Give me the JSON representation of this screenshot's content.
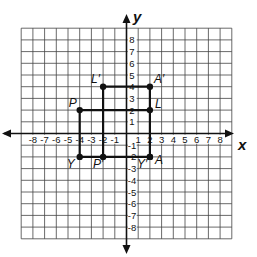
{
  "diagram": {
    "type": "coordinate-grid",
    "x_range": [
      -9,
      9
    ],
    "y_range": [
      -9,
      9
    ],
    "axes": {
      "x_label": "x",
      "y_label": "y"
    },
    "x_tick_labels": [
      "-8",
      "-7",
      "-6",
      "-5",
      "-4",
      "-3",
      "-2",
      "-1",
      "1",
      "2",
      "3",
      "4",
      "5",
      "6",
      "7",
      "8"
    ],
    "y_tick_labels": [
      "8",
      "7",
      "6",
      "5",
      "4",
      "3",
      "2",
      "1",
      "-1",
      "-2",
      "-3",
      "-4",
      "-5",
      "-6",
      "-7",
      "-8"
    ],
    "points": [
      {
        "label": "L′",
        "x": -2,
        "y": 4
      },
      {
        "label": "A′",
        "x": 2,
        "y": 4
      },
      {
        "label": "P",
        "x": -4,
        "y": 2
      },
      {
        "label": "L",
        "x": 2,
        "y": 2
      },
      {
        "label": "Y",
        "x": -4,
        "y": -2
      },
      {
        "label": "P′",
        "x": -2,
        "y": -2
      },
      {
        "label": "Y′",
        "x": 2,
        "y": -2
      },
      {
        "label": "A",
        "x": 2,
        "y": -2
      }
    ],
    "segments": [
      {
        "from": "L′",
        "to": "A′"
      },
      {
        "from": "A′",
        "to": "L"
      },
      {
        "from": "L",
        "to": "P"
      },
      {
        "from": "P",
        "to": "Y"
      },
      {
        "from": "Y",
        "to": "A"
      },
      {
        "from": "A",
        "to": "L"
      },
      {
        "from": "L′",
        "to": "P′"
      }
    ],
    "colors": {
      "grid": "#444444",
      "ink": "#111111",
      "background": "#ffffff"
    }
  }
}
